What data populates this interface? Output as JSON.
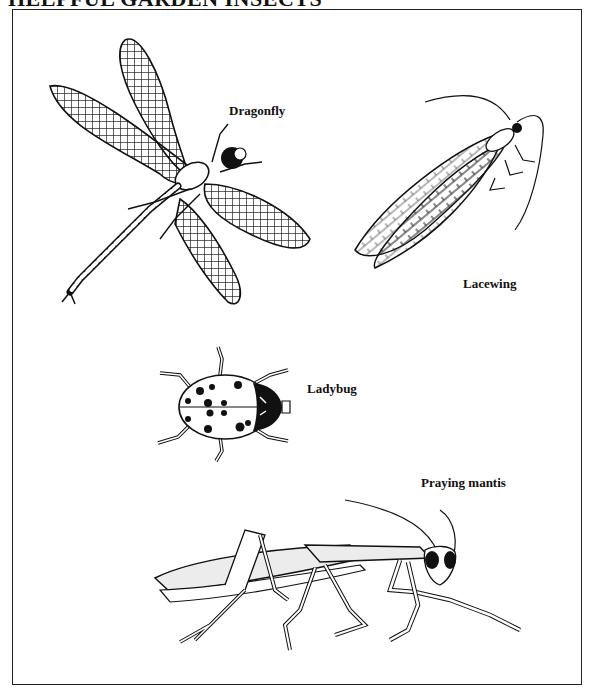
{
  "page": {
    "title": "HELPFUL GARDEN INSECTS"
  },
  "figures": [
    {
      "name": "dragonfly",
      "label": "Dragonfly"
    },
    {
      "name": "lacewing",
      "label": "Lacewing"
    },
    {
      "name": "ladybug",
      "label": "Ladybug"
    },
    {
      "name": "praying-mantis",
      "label": "Praying mantis"
    }
  ],
  "colors": {
    "ink": "#111111",
    "paper": "#ffffff",
    "frame": "#222222"
  }
}
